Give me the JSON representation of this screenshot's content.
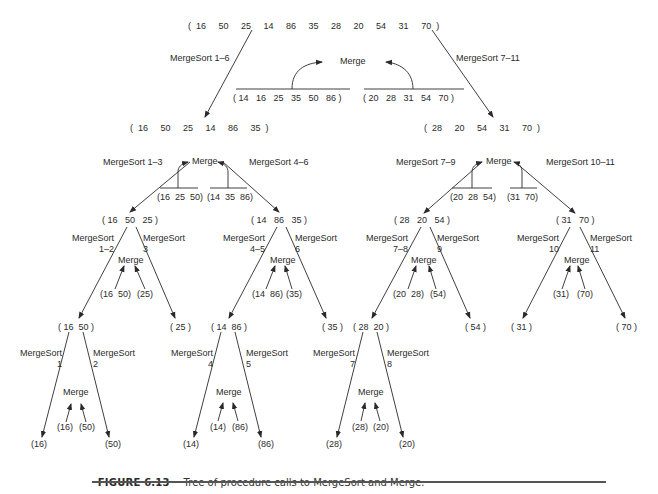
{
  "figure": {
    "number": "FIGURE 6.13",
    "caption": "Tree of procedure calls to MergeSort and Merge."
  },
  "nodes": {
    "root": "(  16     50     25     14     86     35     28     20     54     31     70  )",
    "l": "(  16     50     25     14     86     35  )",
    "r": "(  28     20     54     31     70  )",
    "ll": "( 16   50   25 )",
    "lr": "( 14   86   35 )",
    "rl": "( 28   20   54 )",
    "rr": "( 31   70 )",
    "lll": "( 16  50 )",
    "llr": "( 25 )",
    "lrl": "( 14  86 )",
    "lrr": "( 35 )",
    "rll": "( 28  20 )",
    "rlr": "( 54 )",
    "rrl": "( 31 )",
    "rrr": "( 70 )",
    "leaf_16": "(16)",
    "leaf_50": "(50)",
    "leaf_14": "(14)",
    "leaf_86": "(86)",
    "leaf_28": "(28)",
    "leaf_20": "(20)"
  },
  "calls": {
    "root_left": "MergeSort 1–6",
    "root_right": "MergeSort 7–11",
    "l_left": "MergeSort 1–3",
    "l_right": "MergeSort 4–6",
    "r_left": "MergeSort 7–9",
    "r_right": "MergeSort 10–11",
    "ll_left": "MergeSort\n1–2",
    "ll_right": "MergeSort\n3",
    "lr_left": "MergeSort\n4–5",
    "lr_right": "MergeSort\n6",
    "rl_left": "MergeSort\n7–8",
    "rl_right": "MergeSort\n9",
    "rr_left": "MergeSort\n10",
    "rr_right": "MergeSort\n11",
    "lll_left": "MergeSort\n1",
    "lll_right": "MergeSort\n2",
    "lrl_left": "MergeSort\n4",
    "lrl_right": "MergeSort\n5",
    "rll_left": "MergeSort\n7",
    "rll_right": "MergeSort\n8"
  },
  "merges": {
    "label": "Merge",
    "root": {
      "left": "( 14   16   25   35   50   86 )",
      "right": "( 20   28   31   54   70 )"
    },
    "l": {
      "left": "(16  25  50)",
      "right": "(14  35  86)"
    },
    "r": {
      "left": "(20  28  54)",
      "right": "(31  70)"
    },
    "ll": {
      "left": "(16  50)",
      "right": "(25)"
    },
    "lr": {
      "left": "(14  86)",
      "right": "(35)"
    },
    "rl": {
      "left": "(20  28)",
      "right": "(54)"
    },
    "rr": {
      "left": "(31)",
      "right": "(70)"
    },
    "lll": {
      "left": "(16)",
      "right": "(50)"
    },
    "lrl": {
      "left": "(14)",
      "right": "(86)"
    },
    "rll": {
      "left": "(28)",
      "right": "(20)"
    }
  }
}
